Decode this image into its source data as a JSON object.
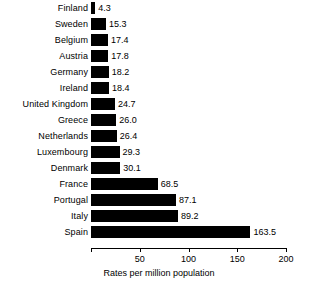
{
  "chart_data": {
    "type": "bar",
    "orientation": "horizontal",
    "title": "",
    "subtitle": "",
    "xlabel": "Rates per million population",
    "ylabel": "",
    "xlim": [
      0,
      200
    ],
    "xticks": [
      0,
      50,
      100,
      150,
      200
    ],
    "xtick_labels": [
      "",
      "50",
      "100",
      "150",
      "200"
    ],
    "grid": false,
    "legend": false,
    "bar_color": "#000000",
    "value_labels": true,
    "categories": [
      "Finland",
      "Sweden",
      "Belgium",
      "Austria",
      "Germany",
      "Ireland",
      "United Kingdom",
      "Greece",
      "Netherlands",
      "Luxembourg",
      "Denmark",
      "France",
      "Portugal",
      "Italy",
      "Spain"
    ],
    "values": [
      4.3,
      15.3,
      17.4,
      17.8,
      18.2,
      18.4,
      24.7,
      26.0,
      26.4,
      29.3,
      30.1,
      68.5,
      87.1,
      89.2,
      163.5
    ],
    "value_label_texts": [
      "4.3",
      "15.3",
      "17.4",
      "17.8",
      "18.2",
      "18.4",
      "24.7",
      "26.0",
      "26.4",
      "29.3",
      "30.1",
      "68.5",
      "87.1",
      "89.2",
      "163.5"
    ]
  }
}
